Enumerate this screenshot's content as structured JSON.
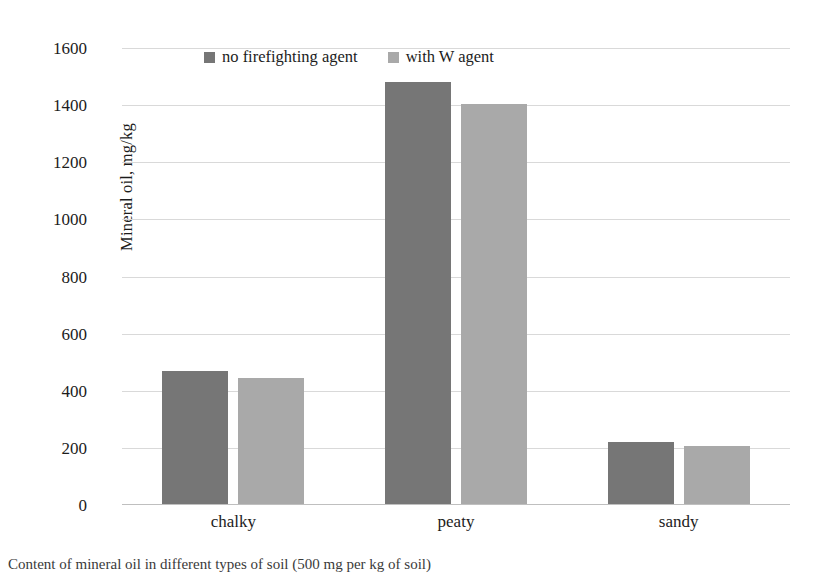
{
  "chart_data": {
    "type": "bar",
    "title": "",
    "xlabel": "",
    "ylabel": "Mineral oil, mg/kg",
    "categories": [
      "chalky",
      "peaty",
      "sandy"
    ],
    "series": [
      {
        "name": "no firefighting agent",
        "color": "#767676",
        "values": [
          470,
          1480,
          220
        ]
      },
      {
        "name": "with W agent",
        "color": "#a9a9a9",
        "values": [
          443,
          1405,
          208
        ]
      }
    ],
    "ylim": [
      0,
      1600
    ],
    "yticks": [
      0,
      200,
      400,
      600,
      800,
      1000,
      1200,
      1400,
      1600
    ],
    "ytick_labels": [
      "0",
      "200",
      "400",
      "600",
      "800",
      "1000",
      "1200",
      "1400",
      "1600"
    ],
    "grid": true,
    "legend_position": "top-center"
  },
  "caption": {
    "text": "Content of mineral oil in different types of soil (500 mg per kg of soil)"
  }
}
